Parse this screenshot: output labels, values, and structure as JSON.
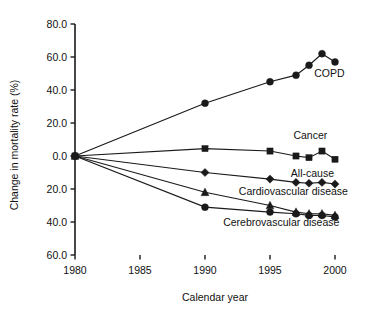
{
  "chart_data": {
    "type": "line",
    "title": "",
    "xlabel": "Calendar year",
    "ylabel": "Change in mortality rate (%)",
    "xlim": [
      1980,
      2001
    ],
    "ylim": [
      -60,
      80
    ],
    "xticks": [
      1980,
      1985,
      1990,
      1995,
      2000
    ],
    "xticklabels": [
      "1980",
      "1985",
      "1990",
      "1995",
      "2000"
    ],
    "yticks": [
      80,
      60,
      40,
      20,
      0,
      -20,
      -40,
      -60
    ],
    "yticklabels": [
      "80.0",
      "60.0",
      "40.0",
      "20.0",
      "0.0",
      "20.0",
      "40.0",
      "60.0"
    ],
    "grid": false,
    "legend_position": "inline-annotations",
    "series": [
      {
        "name": "COPD",
        "marker": "circle",
        "label": "COPD",
        "x": [
          1980,
          1990,
          1995,
          1997,
          1998,
          1999,
          2000
        ],
        "values": [
          0.0,
          32.0,
          45.0,
          49.0,
          55.0,
          62.0,
          57.0
        ]
      },
      {
        "name": "Cancer",
        "marker": "square",
        "label": "Cancer",
        "x": [
          1980,
          1990,
          1995,
          1997,
          1998,
          1999,
          2000
        ],
        "values": [
          0.0,
          4.5,
          3.0,
          0.0,
          -1.0,
          3.0,
          -2.0
        ]
      },
      {
        "name": "All-cause",
        "marker": "diamond",
        "label": "All-cause",
        "x": [
          1980,
          1990,
          1995,
          1997,
          1998,
          1999,
          2000
        ],
        "values": [
          0.0,
          -10.0,
          -14.0,
          -16.0,
          -16.5,
          -16.0,
          -17.0
        ]
      },
      {
        "name": "Cardiovascular disease",
        "marker": "triangle",
        "label": "Cardiovascular disease",
        "x": [
          1980,
          1990,
          1995,
          1997,
          1998,
          1999,
          2000
        ],
        "values": [
          0.0,
          -22.0,
          -30.0,
          -34.0,
          -35.0,
          -35.0,
          -36.0
        ]
      },
      {
        "name": "Cerebrovascular disease",
        "marker": "circle",
        "label": "Cerebrovascular disease",
        "x": [
          1980,
          1990,
          1995,
          1997,
          1998,
          1999,
          2000
        ],
        "values": [
          0.0,
          -31.0,
          -34.0,
          -35.0,
          -36.0,
          -36.0,
          -37.0
        ]
      }
    ],
    "annotations": [
      {
        "text": "COPD",
        "x": 1998.4,
        "y": 48.0,
        "anchor": "start"
      },
      {
        "text": "Cancer",
        "x": 1996.8,
        "y": 10.5,
        "anchor": "start"
      },
      {
        "text": "All-cause",
        "x": 1996.6,
        "y": -12.5,
        "anchor": "start"
      },
      {
        "text": "Cardiovascular disease",
        "x": 1992.6,
        "y": -23.5,
        "anchor": "start"
      },
      {
        "text": "Cerebrovascular disease",
        "x": 1991.4,
        "y": -42.5,
        "anchor": "start"
      }
    ],
    "colors": {
      "ink": "#1a1a1a",
      "background": "#ffffff"
    }
  }
}
